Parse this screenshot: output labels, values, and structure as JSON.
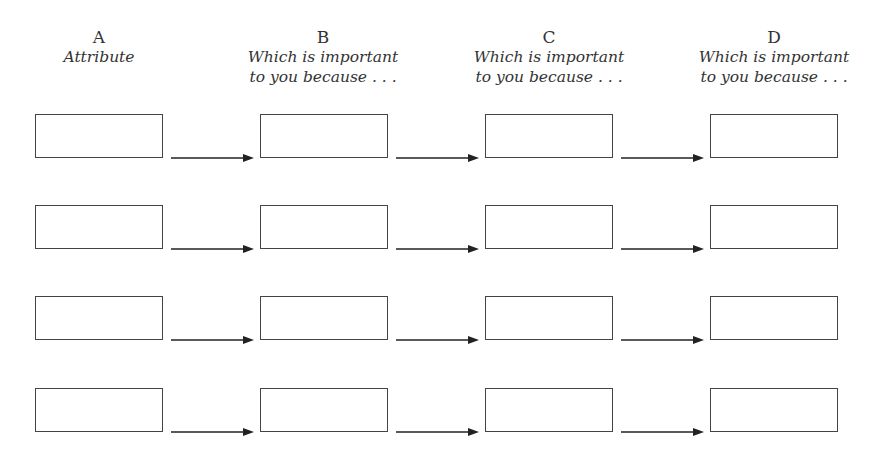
{
  "columns": [
    {
      "letter": "A",
      "subtitle_line1": "Attribute",
      "subtitle_line2": ""
    },
    {
      "letter": "B",
      "subtitle_line1": "Which is important",
      "subtitle_line2": "to you because . . ."
    },
    {
      "letter": "C",
      "subtitle_line1": "Which is important",
      "subtitle_line2": "to you because . . ."
    },
    {
      "letter": "D",
      "subtitle_line1": "Which is important",
      "subtitle_line2": "to you because . . ."
    }
  ],
  "rows": 4,
  "layout": {
    "box_x": [
      35,
      260,
      485,
      710
    ],
    "row_y": [
      114,
      205,
      296,
      388
    ],
    "arrow_color": "#222222",
    "box_border_color": "#444444"
  }
}
